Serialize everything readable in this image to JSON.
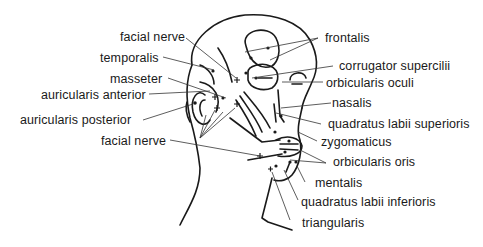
{
  "diagram": {
    "labels": {
      "facial_nerve_top": "facial nerve",
      "temporalis": "temporalis",
      "masseter": "masseter",
      "auricularis_anterior": "auricularis anterior",
      "auricularis_posterior": "auricularis posterior",
      "facial_nerve_bottom": "facial nerve",
      "frontalis": "frontalis",
      "corrugator_supercilii": "corrugator supercilii",
      "orbicularis_oculi": "orbicularis oculi",
      "nasalis": "nasalis",
      "quadratus_labii_superioris": "quadratus labii superioris",
      "zygomaticus": "zygomaticus",
      "orbicularis_oris": "orbicularis oris",
      "mentalis": "mentalis",
      "quadratus_labii_inferioris": "quadratus labii inferioris",
      "triangularis": "triangularis"
    },
    "colors": {
      "ink": "#1a1a1a",
      "background": "#ffffff"
    }
  }
}
